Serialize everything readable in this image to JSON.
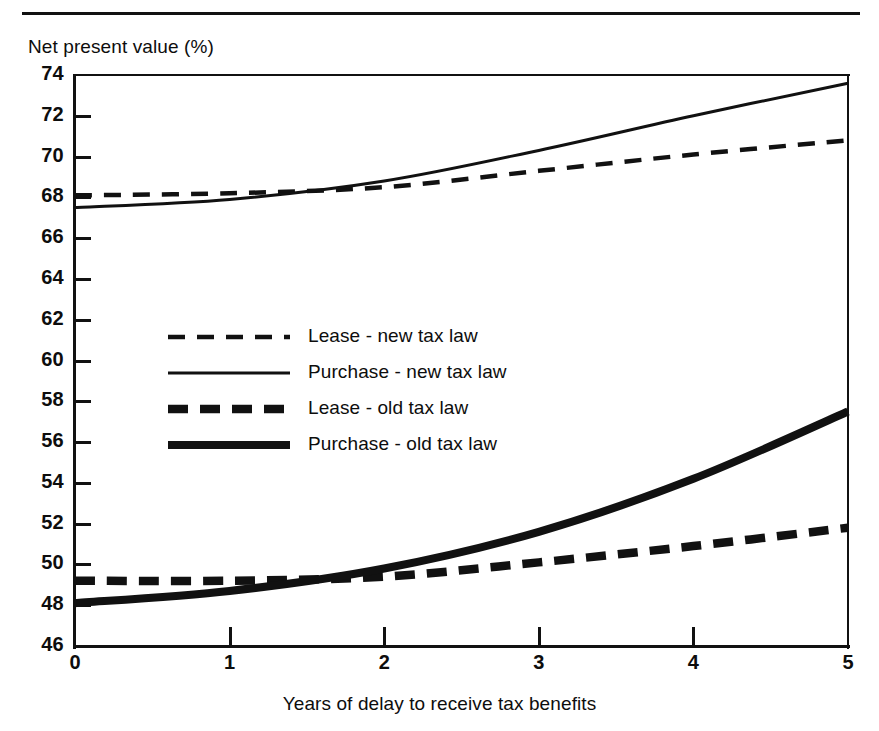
{
  "figure": {
    "y_axis_label": "Net present value (%)",
    "x_axis_label": "Years of delay to receive tax benefits"
  },
  "axes": {
    "y_ticks": [
      "74",
      "72",
      "70",
      "68",
      "66",
      "64",
      "62",
      "60",
      "58",
      "56",
      "54",
      "52",
      "50",
      "48",
      "46"
    ],
    "x_ticks": [
      "0",
      "1",
      "2",
      "3",
      "4",
      "5"
    ]
  },
  "legend": {
    "entries": [
      {
        "label": "Lease - new tax law",
        "style": "thin-dashed"
      },
      {
        "label": "Purchase - new tax law",
        "style": "thin-solid"
      },
      {
        "label": "Lease - old tax law",
        "style": "thick-dashed"
      },
      {
        "label": "Purchase - old tax law",
        "style": "thick-solid"
      }
    ]
  },
  "chart_data": {
    "type": "line",
    "title": "",
    "xlabel": "Years of delay to receive tax benefits",
    "ylabel": "Net present value (%)",
    "xlim": [
      0,
      5
    ],
    "ylim": [
      46,
      74
    ],
    "ytick_step": 2,
    "xtick_step": 1,
    "grid": false,
    "legend_position": "center-left inside plot",
    "x": [
      0,
      1,
      2,
      3,
      4,
      5
    ],
    "series": [
      {
        "name": "Lease - new tax law",
        "style": "thin-dashed",
        "color": "#111111",
        "values": [
          68.1,
          68.2,
          68.5,
          69.3,
          70.1,
          70.8
        ]
      },
      {
        "name": "Purchase - new tax law",
        "style": "thin-solid",
        "color": "#111111",
        "values": [
          67.5,
          67.9,
          68.8,
          70.3,
          72.0,
          73.6
        ]
      },
      {
        "name": "Lease - old tax law",
        "style": "thick-dashed",
        "color": "#111111",
        "values": [
          49.2,
          49.2,
          49.4,
          50.1,
          50.9,
          51.8
        ]
      },
      {
        "name": "Purchase - old tax law",
        "style": "thick-solid",
        "color": "#111111",
        "values": [
          48.1,
          48.7,
          49.8,
          51.6,
          54.2,
          57.5
        ]
      }
    ],
    "annotations": [
      "New-tax-law purchase curve crosses above the new-tax-law lease curve near x = 1.2",
      "Old-tax-law purchase curve crosses above the old-tax-law lease curve near x = 1.5"
    ]
  }
}
